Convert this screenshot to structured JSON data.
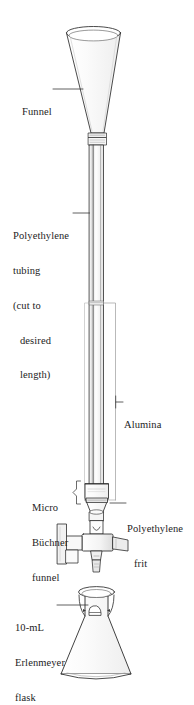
{
  "figure": {
    "background_color": "#ffffff",
    "line_color": "#2b2b2b"
  },
  "labels": {
    "funnel": "Funnel",
    "tubing_line1": "Polyethylene",
    "tubing_line2": "tubing",
    "tubing_line3": "(cut to",
    "tubing_line4": "desired",
    "tubing_line5": "length)",
    "alumina": "Alumina",
    "buchner_line1": "Micro",
    "buchner_line2": "Büchner",
    "buchner_line3": "funnel",
    "frit_line1": "Polyethylene",
    "frit_line2": "frit",
    "flask_line1": "10-mL",
    "flask_line2": "Erlenmeyer",
    "flask_line3": "flask"
  },
  "parts": [
    {
      "name": "funnel",
      "label": "Funnel"
    },
    {
      "name": "polyethylene-tubing",
      "label": "Polyethylene tubing (cut to desired length)"
    },
    {
      "name": "alumina",
      "label": "Alumina"
    },
    {
      "name": "micro-buchner-funnel",
      "label": "Micro Büchner funnel"
    },
    {
      "name": "polyethylene-frit",
      "label": "Polyethylene frit"
    },
    {
      "name": "stopcock",
      "label": "Stopcock"
    },
    {
      "name": "erlenmeyer-flask",
      "label": "10-mL Erlenmeyer flask"
    }
  ]
}
